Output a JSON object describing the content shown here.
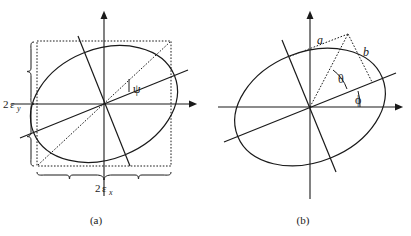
{
  "figure": {
    "background_color": "#ffffff",
    "stroke_color": "#1a1a1a",
    "panels": [
      {
        "id": "a",
        "caption": "(a)",
        "center": {
          "x": 104,
          "y": 104
        },
        "labels": {
          "width_label_base": "2",
          "width_label_eps": "ε",
          "width_label_sub": "x",
          "width_label_full": "2εx",
          "height_label_base": "2",
          "height_label_eps": "ε",
          "height_label_sub": "y",
          "height_label_full": "2εy",
          "angle_label": "ψ"
        },
        "ellipse": {
          "rx": 76,
          "ry": 55,
          "rotation_deg": -22
        },
        "bounding_box": {
          "x": 37,
          "y": 41,
          "width": 134,
          "height": 125
        },
        "axes": {
          "x_axis": {
            "x1": 12,
            "y1": 104,
            "x2": 196,
            "y2": 104
          },
          "y_axis": {
            "x1": 104,
            "y1": 14,
            "x2": 104,
            "y2": 196
          }
        },
        "principal_axis_angle_deg": -22,
        "diagonal_style": "dashed"
      },
      {
        "id": "b",
        "caption": "(b)",
        "center": {
          "x": 310,
          "y": 107
        },
        "labels": {
          "semi_major": "a",
          "semi_minor": "b",
          "theta": "θ",
          "phi": "ϕ"
        },
        "ellipse": {
          "rx": 78,
          "ry": 55,
          "rotation_deg": -22
        },
        "axes": {
          "x_axis": {
            "x1": 218,
            "y1": 107,
            "x2": 402,
            "y2": 107
          },
          "y_axis": {
            "x1": 310,
            "y1": 14,
            "x2": 310,
            "y2": 199
          }
        },
        "apex_point": {
          "x": 348,
          "y": 34
        },
        "principal_axis_angle_deg": -22,
        "triangle_style": "dashed"
      }
    ]
  }
}
